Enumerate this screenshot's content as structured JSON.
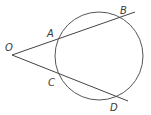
{
  "diagram": {
    "type": "geometry-secants",
    "circle": {
      "cx": 99,
      "cy": 56,
      "r": 44,
      "stroke": "#555555"
    },
    "external_point": {
      "name": "O",
      "x": 12,
      "y": 55
    },
    "secants": [
      {
        "name": "secant-OB",
        "from": [
          12,
          55
        ],
        "to": [
          135,
          12
        ],
        "points": [
          "A",
          "B"
        ]
      },
      {
        "name": "secant-OD",
        "from": [
          12,
          55
        ],
        "to": [
          128,
          101
        ],
        "points": [
          "C",
          "D"
        ]
      }
    ],
    "labels": [
      {
        "id": "O",
        "text": "O",
        "x": 5,
        "y": 51
      },
      {
        "id": "A",
        "text": "A",
        "x": 47,
        "y": 37
      },
      {
        "id": "B",
        "text": "B",
        "x": 120,
        "y": 14
      },
      {
        "id": "C",
        "text": "C",
        "x": 48,
        "y": 86
      },
      {
        "id": "D",
        "text": "D",
        "x": 110,
        "y": 111
      }
    ],
    "line_color": "#444444"
  }
}
